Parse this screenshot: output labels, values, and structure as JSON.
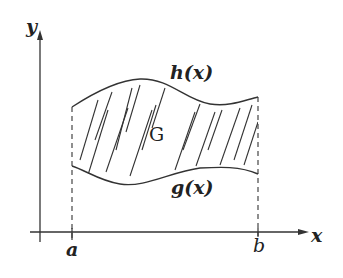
{
  "diagram": {
    "type": "region-between-curves",
    "axes": {
      "x_label": "x",
      "y_label": "y"
    },
    "bounds": {
      "left_label": "a",
      "right_label": "b"
    },
    "curves": {
      "upper_label": "h(x)",
      "lower_label": "g(x)"
    },
    "region_label": "G",
    "colors": {
      "stroke": "#333333",
      "background": "#ffffff"
    }
  }
}
